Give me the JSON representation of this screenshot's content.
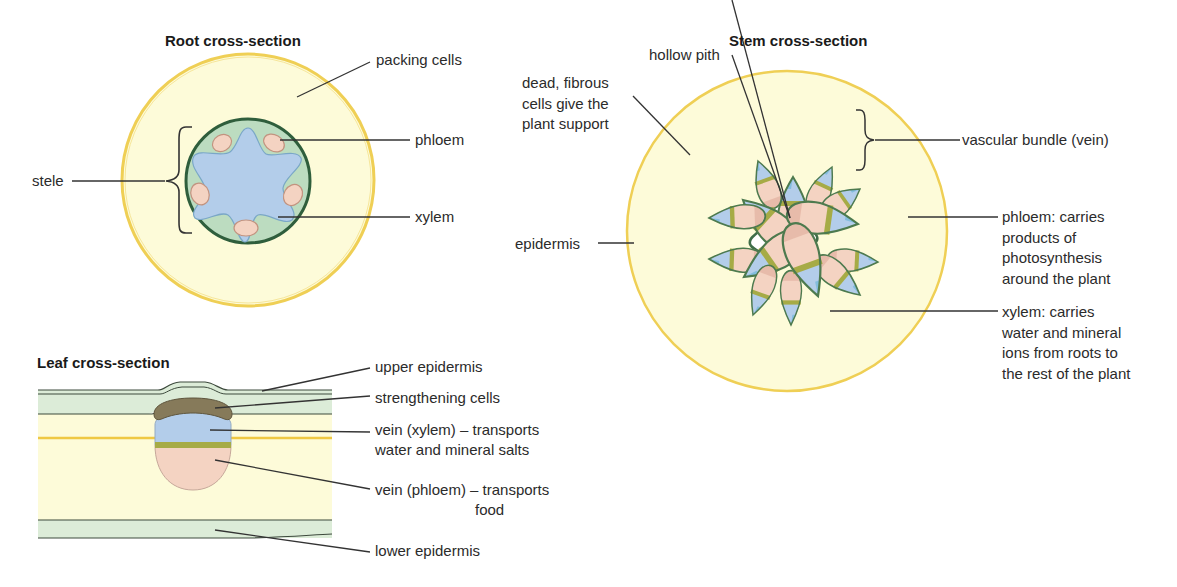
{
  "root": {
    "title": "Root cross-section",
    "labels": {
      "packing_cells": "packing cells",
      "phloem": "phloem",
      "stele": "stele",
      "xylem": "xylem"
    }
  },
  "stem": {
    "title": "Stem cross-section",
    "labels": {
      "hollow_pith": "hollow pith",
      "fibrous": "dead, fibrous\ncells give the\nplant support",
      "vascular_bundle": "vascular bundle (vein)",
      "epidermis": "epidermis",
      "phloem": "phloem: carries\nproducts of\nphotosynthesis\naround the plant",
      "xylem": "xylem: carries\nwater and mineral\nions from roots to\nthe rest of the plant"
    }
  },
  "leaf": {
    "title": "Leaf cross-section",
    "labels": {
      "upper_epidermis": "upper epidermis",
      "strengthening_cells": "strengthening cells",
      "vein_xylem": "vein (xylem) – transports\nwater and mineral salts",
      "vein_phloem": "vein (phloem) – transports\n                        food",
      "lower_epidermis": "lower epidermis"
    }
  },
  "colors": {
    "cortex": "#fdfbd9",
    "epidermis_ring": "#efcf55",
    "stele_fill": "#bcdcc0",
    "stele_outline": "#2f5e3c",
    "xylem": "#b3cdea",
    "phloem": "#f4d3c2",
    "cambium": "#a6ab46",
    "bundle_outline": "#4d7a4e",
    "strengthening": "#867a5a",
    "leaf_epidermis": "#dcecd8"
  }
}
